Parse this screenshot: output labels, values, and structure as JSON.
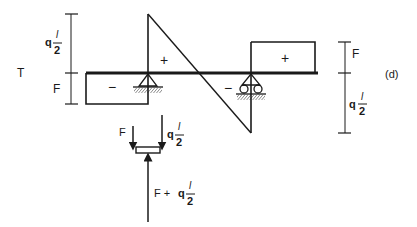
{
  "diagram": {
    "figure_label": "(d)",
    "diagram_label": "T",
    "signs": {
      "left_region": "−",
      "triangle_region": "+",
      "middle_negative": "−",
      "right_region": "+"
    },
    "left_dimension": {
      "upper": {
        "coef": "q",
        "num": "l",
        "den": "2"
      },
      "lower": "F"
    },
    "right_dimension": {
      "upper": "F",
      "lower": {
        "coef": "q",
        "num": "l",
        "den": "2"
      }
    },
    "free_body": {
      "left_force": "F",
      "right_force": {
        "coef": "q",
        "num": "l",
        "den": "2"
      },
      "reaction": {
        "prefix": "F + ",
        "coef": "q",
        "num": "l",
        "den": "2"
      }
    },
    "colors": {
      "line": "#1a1a1a",
      "background": "#ffffff"
    }
  }
}
